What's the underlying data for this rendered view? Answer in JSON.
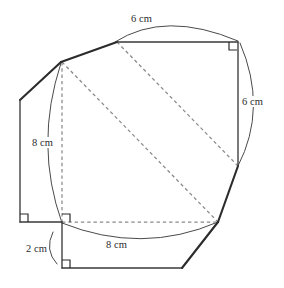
{
  "figure": {
    "kind": "geometry-diagram",
    "units": "cm",
    "stroke_color": "#2b2b2b",
    "dashed_color": "#8a8a8a",
    "arc_color": "#4a4a4a",
    "background_color": "#ffffff"
  },
  "dimensions": {
    "top": {
      "value": "6 cm",
      "number": 6,
      "unit": "cm",
      "position": "top"
    },
    "right": {
      "value": "6 cm",
      "number": 6,
      "unit": "cm",
      "position": "right"
    },
    "left": {
      "value": "8 cm",
      "number": 8,
      "unit": "cm",
      "position": "left"
    },
    "bottom": {
      "value": "8 cm",
      "number": 8,
      "unit": "cm",
      "position": "bottom"
    },
    "small": {
      "value": "2 cm",
      "number": 2,
      "unit": "cm",
      "position": "bottom-left"
    }
  },
  "labels": [
    "6 cm",
    "6 cm",
    "8 cm",
    "8 cm",
    "2 cm"
  ],
  "right_angles": [
    {
      "name": "top-right-corner",
      "x": 236,
      "y": 43
    },
    {
      "name": "left-lower-corner",
      "x": 20,
      "y": 222
    },
    {
      "name": "inner-square-corner",
      "x": 62,
      "y": 222
    },
    {
      "name": "bottom-left-corner",
      "x": 62,
      "y": 268
    }
  ],
  "shapes": {
    "outer_polygon": "irregular heptagon",
    "inner_square": "dashed square, side 8 cm",
    "upper_rectangle": "rectangle 6 cm by 6 cm"
  }
}
